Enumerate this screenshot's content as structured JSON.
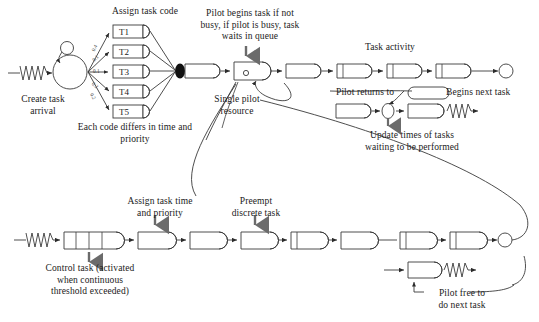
{
  "figure": {
    "type": "diagram",
    "background": "#ffffff",
    "line_color": "#3a3a3a",
    "text_color": "#1a1a1a"
  },
  "labels": {
    "assign_task_code": "Assign task code",
    "create_task_arrival": "Create task\narrival",
    "each_code_differs": "Each code differs in time and\npriority",
    "pilot_begins_task": "Pilot begins task if not\nbusy, if pilot is busy, task\nwaits in queue",
    "single_pilot_resource": "Single pilot\nresource",
    "task_activity": "Task activity",
    "pilot_returns_to": "Pilot returns to",
    "begins_next_task": "Begins next task",
    "update_times": "Update times of tasks\nwaiting to be performed",
    "assign_task_time": "Assign task time\nand priority",
    "preempt_discrete_task": "Preempt\ndiscrete task",
    "control_task": "Control task (activated\nwhen continuous\nthreshold exceeded)",
    "pilot_free_to": "Pilot free to\ndo next task"
  },
  "task_codes": [
    {
      "label": "T1",
      "probability": "0.4"
    },
    {
      "label": "T2",
      "probability": "0.1"
    },
    {
      "label": "T3",
      "probability": "0.1"
    },
    {
      "label": "T4",
      "probability": "0.2"
    },
    {
      "label": "T5",
      "probability": "0.2"
    }
  ],
  "branch_probabilities": [
    "0.4",
    "0.1",
    "0.1",
    "0.2",
    "0.2"
  ],
  "top_row": {
    "source_icon": "zigzag-source-icon",
    "create_node_icon": "circle-node-icon",
    "self_loop_icon": "self-loop-icon",
    "merge_icon": "filled-merge-icon",
    "queue_icon": "queue-icon",
    "resource_icon": "resource-circle-icon",
    "activity_count": 5,
    "sink_icon": "sink-circle-icon"
  },
  "bottom_row": {
    "source_icon": "zigzag-source-icon",
    "segmented_queue_icon": "segmented-queue-icon",
    "activity_count": 6,
    "sink_icon": "sink-circle-icon",
    "terminator_icon": "zigzag-terminator-icon"
  }
}
